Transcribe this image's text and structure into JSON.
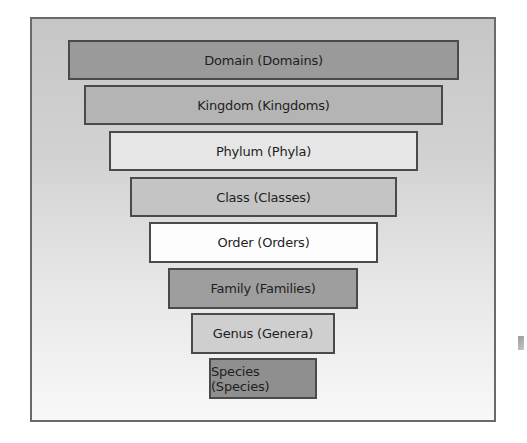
{
  "diagram": {
    "type": "inverted-pyramid",
    "frame": {
      "background_top": "#c6c6c6",
      "background_bottom": "#f8f8f8",
      "border": "#6a6a6a"
    },
    "ranks": [
      {
        "label": "Domain (Domains)",
        "fill": "#9a9a9a",
        "x": 68,
        "y": 40,
        "w": 391,
        "h": 40
      },
      {
        "label": "Kingdom (Kingdoms)",
        "fill": "#b4b4b4",
        "x": 84,
        "y": 85,
        "w": 359,
        "h": 40
      },
      {
        "label": "Phylum (Phyla)",
        "fill": "#e6e6e6",
        "x": 109,
        "y": 131,
        "w": 309,
        "h": 40
      },
      {
        "label": "Class (Classes)",
        "fill": "#c4c4c4",
        "x": 130,
        "y": 177,
        "w": 267,
        "h": 40
      },
      {
        "label": "Order (Orders)",
        "fill": "#fdfdfd",
        "x": 149,
        "y": 222,
        "w": 229,
        "h": 41
      },
      {
        "label": "Family (Families)",
        "fill": "#9e9e9e",
        "x": 168,
        "y": 268,
        "w": 190,
        "h": 41
      },
      {
        "label": "Genus (Genera)",
        "fill": "#cfcfcf",
        "x": 191,
        "y": 313,
        "w": 144,
        "h": 41
      },
      {
        "label": "Species (Species)",
        "fill": "#8f8f8f",
        "x": 209,
        "y": 358,
        "w": 108,
        "h": 41
      }
    ]
  }
}
